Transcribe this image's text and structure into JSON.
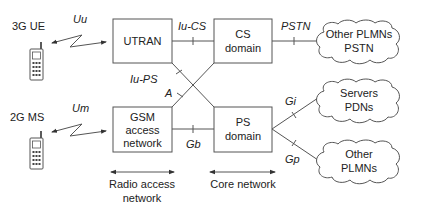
{
  "diagram": {
    "terminals": {
      "ue3g": {
        "label": "3G UE",
        "icon": "mobile-phone-icon"
      },
      "ms2g": {
        "label": "2G MS",
        "icon": "mobile-phone-icon"
      }
    },
    "air_interfaces": {
      "uu": "Uu",
      "um": "Um"
    },
    "nodes": {
      "utran": {
        "lines": [
          "UTRAN"
        ]
      },
      "gsm": {
        "lines": [
          "GSM",
          "access",
          "network"
        ]
      },
      "cs": {
        "lines": [
          "CS",
          "domain"
        ]
      },
      "ps": {
        "lines": [
          "PS",
          "domain"
        ]
      }
    },
    "interfaces": {
      "iucs": "Iu-CS",
      "iups": "Iu-PS",
      "a": "A",
      "gb": "Gb",
      "pstn": "PSTN",
      "gi": "Gi",
      "gp": "Gp"
    },
    "clouds": {
      "c1": {
        "lines": [
          "Other PLMNs",
          "PSTN"
        ]
      },
      "c2": {
        "lines": [
          "Servers",
          "PDNs"
        ]
      },
      "c3": {
        "lines": [
          "Other",
          "PLMNs"
        ]
      }
    },
    "spans": {
      "radio": {
        "lines": [
          "Radio access",
          "network"
        ]
      },
      "core": {
        "lines": [
          "Core network"
        ]
      }
    }
  }
}
